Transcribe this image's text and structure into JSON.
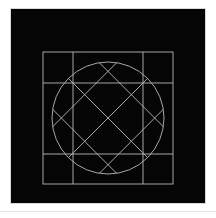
{
  "page": {
    "background_color": "#ffffff",
    "width": 216,
    "height": 218,
    "separator_color": "#e2e2e2"
  },
  "figure": {
    "title": "",
    "panel_background": "#050505",
    "stroke_color": "#b9b9b9",
    "stroke_width": 0.9,
    "panel": {
      "x": 11,
      "y": 9,
      "width": 194,
      "height": 194
    },
    "elements": [
      {
        "name": "outer-square",
        "type": "rect",
        "x": 32,
        "y": 43,
        "width": 130,
        "height": 132
      },
      {
        "name": "inscribed-circle",
        "type": "circle",
        "cx": 97,
        "cy": 109,
        "r": 56
      },
      {
        "name": "grid-line-vertical-left",
        "type": "line",
        "x1": 62,
        "y1": 43,
        "x2": 62,
        "y2": 175
      },
      {
        "name": "grid-line-vertical-right",
        "type": "line",
        "x1": 132,
        "y1": 43,
        "x2": 132,
        "y2": 175
      },
      {
        "name": "grid-line-horizontal-top",
        "type": "line",
        "x1": 32,
        "y1": 74,
        "x2": 162,
        "y2": 74
      },
      {
        "name": "grid-line-horizontal-bottom",
        "type": "line",
        "x1": 32,
        "y1": 145,
        "x2": 162,
        "y2": 145
      },
      {
        "name": "diagonal-lattice",
        "type": "diagonals",
        "count": 8,
        "orientation": "45deg and 135deg"
      }
    ],
    "grid": {
      "columns": 3,
      "rows": 3,
      "vertical_divider_x": [
        62,
        132
      ],
      "horizontal_divider_y": [
        74,
        145
      ],
      "square_left": 32,
      "square_top": 43,
      "square_right": 162,
      "square_bottom": 175
    },
    "diagonals": {
      "spacing": 33,
      "offsets_down_right": [
        -66,
        -33,
        0,
        33,
        66
      ],
      "offsets_down_left": [
        -66,
        -33,
        0,
        33,
        66
      ]
    }
  }
}
